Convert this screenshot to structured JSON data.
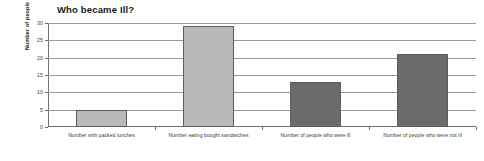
{
  "chart_data": {
    "type": "bar",
    "title": "Who became Ill?",
    "xlabel": "",
    "ylabel": "Number of people",
    "categories": [
      "Number with packed lunches",
      "Number eating bought sandwiches",
      "Number of people who were ill",
      "Number of people who were not ill"
    ],
    "values": [
      5,
      29,
      13,
      21
    ],
    "ylim": [
      0,
      30
    ],
    "yticks": [
      0,
      5,
      10,
      15,
      20,
      25,
      30
    ],
    "ytick_labels": [
      "0",
      "5",
      "10",
      "15",
      "20",
      "25",
      "30"
    ],
    "grid": true,
    "legend": false,
    "bar_colors": [
      "#b9b9b9",
      "#b9b9b9",
      "#6b6b6b",
      "#6b6b6b"
    ],
    "bar_edge_color": "#5d5d5d",
    "axis_color": "#6f6f6f",
    "grid_color": "#9a9a9a",
    "background": "#ffffff"
  }
}
